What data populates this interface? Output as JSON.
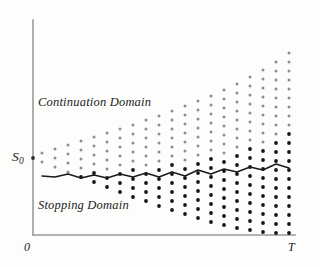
{
  "figure": {
    "labels": {
      "continuation": "Continuation Domain",
      "stopping": "Stopping Domain",
      "s0_base": "S",
      "s0_sub": "0",
      "origin": "0",
      "terminal": "T"
    },
    "colors": {
      "axis": "#9a9a9a",
      "boundary": "#1a1a1a",
      "continuation_dot": "#8d8d8d",
      "stopping_dot": "#161616",
      "background": "#fdfdfb"
    }
  },
  "chart_data": {
    "type": "scatter",
    "xlabel": "",
    "ylabel": "",
    "xlim": [
      0,
      20
    ],
    "ylim": [
      0,
      20
    ],
    "grid": false,
    "legend": "none",
    "annotations": [
      {
        "text": "Continuation Domain",
        "x": 0.9,
        "y": 13.7
      },
      {
        "text": "Stopping Domain",
        "x": 0.9,
        "y": 2.9
      },
      {
        "text": "S_0",
        "x": -1.0,
        "y": 8.6
      },
      {
        "text": "0",
        "x": 0.0,
        "y": -1.0
      },
      {
        "text": "T",
        "x": 20.0,
        "y": -1.0
      }
    ],
    "axes": {
      "x_axis_px": {
        "x1": 33,
        "x2": 295,
        "y": 235
      },
      "y_axis_px": {
        "x": 33,
        "y1": 20,
        "y2": 235
      },
      "s0_tick_px": {
        "x": 33,
        "y": 158
      }
    },
    "lattice": {
      "description": "Recombining binomial tree: column i has i+2 nodes, spaced 9px vertically, 13px horizontally, centered on S0 and drifting upward.",
      "col_spacing_px": 13,
      "row_spacing_px": 9,
      "first_col_x_px": 42,
      "s0_y_px": 158,
      "n_columns": 20,
      "columns": [
        {
          "i": 0,
          "x": 42,
          "count": 2,
          "top_y": 153,
          "cont": 2,
          "stop": 0
        },
        {
          "i": 1,
          "x": 55,
          "count": 3,
          "top_y": 149,
          "cont": 3,
          "stop": 0
        },
        {
          "i": 2,
          "x": 68,
          "count": 4,
          "top_y": 145,
          "cont": 4,
          "stop": 0
        },
        {
          "i": 3,
          "x": 81,
          "count": 5,
          "top_y": 141,
          "cont": 4,
          "stop": 1
        },
        {
          "i": 4,
          "x": 94,
          "count": 6,
          "top_y": 137,
          "cont": 4,
          "stop": 2
        },
        {
          "i": 5,
          "x": 107,
          "count": 7,
          "top_y": 133,
          "cont": 5,
          "stop": 2
        },
        {
          "i": 6,
          "x": 120,
          "count": 8,
          "top_y": 129,
          "cont": 5,
          "stop": 3
        },
        {
          "i": 7,
          "x": 133,
          "count": 9,
          "top_y": 125,
          "cont": 5,
          "stop": 4
        },
        {
          "i": 8,
          "x": 146,
          "count": 10,
          "top_y": 120,
          "cont": 6,
          "stop": 4
        },
        {
          "i": 9,
          "x": 159,
          "count": 11,
          "top_y": 116,
          "cont": 6,
          "stop": 5
        },
        {
          "i": 10,
          "x": 172,
          "count": 12,
          "top_y": 111,
          "cont": 6,
          "stop": 6
        },
        {
          "i": 11,
          "x": 185,
          "count": 13,
          "top_y": 106,
          "cont": 7,
          "stop": 6
        },
        {
          "i": 12,
          "x": 198,
          "count": 14,
          "top_y": 101,
          "cont": 7,
          "stop": 7
        },
        {
          "i": 13,
          "x": 211,
          "count": 15,
          "top_y": 96,
          "cont": 7,
          "stop": 8
        },
        {
          "i": 14,
          "x": 224,
          "count": 16,
          "top_y": 90,
          "cont": 8,
          "stop": 8
        },
        {
          "i": 15,
          "x": 237,
          "count": 17,
          "top_y": 84,
          "cont": 8,
          "stop": 9
        },
        {
          "i": 16,
          "x": 250,
          "count": 18,
          "top_y": 77,
          "cont": 8,
          "stop": 10
        },
        {
          "i": 17,
          "x": 263,
          "count": 19,
          "top_y": 70,
          "cont": 9,
          "stop": 10
        },
        {
          "i": 18,
          "x": 276,
          "count": 20,
          "top_y": 62,
          "cont": 9,
          "stop": 11
        },
        {
          "i": 19,
          "x": 289,
          "count": 21,
          "top_y": 53,
          "cont": 9,
          "stop": 12
        }
      ]
    },
    "boundary_curve": {
      "name": "exercise boundary",
      "points_px": [
        [
          42,
          176
        ],
        [
          55,
          177
        ],
        [
          68,
          174
        ],
        [
          81,
          178
        ],
        [
          94,
          175
        ],
        [
          107,
          178
        ],
        [
          120,
          174
        ],
        [
          133,
          177
        ],
        [
          146,
          173
        ],
        [
          159,
          177
        ],
        [
          172,
          172
        ],
        [
          185,
          176
        ],
        [
          198,
          170
        ],
        [
          211,
          174
        ],
        [
          224,
          169
        ],
        [
          237,
          172
        ],
        [
          250,
          167
        ],
        [
          263,
          170
        ],
        [
          276,
          164
        ],
        [
          289,
          168
        ]
      ]
    }
  }
}
